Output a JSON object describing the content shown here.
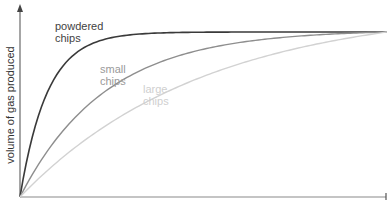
{
  "chart_data": {
    "type": "line",
    "title": "",
    "xlabel": "",
    "ylabel": "volume of gas produced",
    "grid": false,
    "legend": "inline labels",
    "axes": {
      "x_ticks": [],
      "y_ticks": [],
      "arrows": true
    },
    "x": [
      0,
      0.1,
      0.2,
      0.3,
      0.4,
      0.5,
      0.6,
      0.7,
      0.8,
      0.9,
      1.0
    ],
    "series": [
      {
        "name": "powdered chips",
        "color": "#3a3a3a",
        "values": [
          0,
          0.74,
          0.93,
          0.98,
          0.995,
          1.0,
          1.0,
          1.0,
          1.0,
          1.0,
          1.0
        ]
      },
      {
        "name": "small chips",
        "color": "#8e8e8e",
        "values": [
          0,
          0.35,
          0.58,
          0.74,
          0.84,
          0.9,
          0.94,
          0.96,
          0.98,
          0.99,
          1.0
        ]
      },
      {
        "name": "large chips",
        "color": "#d2d2d2",
        "values": [
          0,
          0.18,
          0.34,
          0.48,
          0.6,
          0.7,
          0.78,
          0.85,
          0.91,
          0.96,
          1.0
        ]
      }
    ],
    "ylim": [
      0,
      1.1
    ],
    "xlim": [
      0,
      1.0
    ]
  },
  "labels": {
    "ylabel": "volume of gas produced",
    "powdered_line1": "powdered",
    "powdered_line2": "chips",
    "small_line1": "small",
    "small_line2": "chips",
    "large_line1": "large",
    "large_line2": "chips"
  },
  "colors": {
    "axis": "#777777",
    "powdered": "#3a3a3a",
    "small": "#8e8e8e",
    "large": "#d2d2d2"
  }
}
